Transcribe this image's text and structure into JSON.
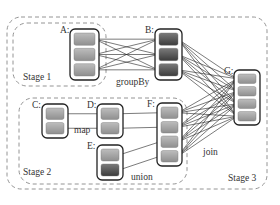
{
  "diagram": {
    "stages": [
      {
        "label": "Stage 1",
        "x": 13,
        "y": 23,
        "w": 93,
        "h": 63
      },
      {
        "label": "Stage 2",
        "x": 19,
        "y": 98,
        "w": 168,
        "h": 86
      },
      {
        "label": "Stage 3",
        "x": 7,
        "y": 17,
        "w": 260,
        "h": 172
      }
    ],
    "rdds": [
      {
        "id": "A",
        "label": "A:",
        "x": 70,
        "y": 29,
        "w": 29,
        "h": 51,
        "partitions": [
          "light",
          "light",
          "light"
        ]
      },
      {
        "id": "B",
        "label": "B:",
        "x": 155,
        "y": 29,
        "w": 27,
        "h": 51,
        "partitions": [
          "dark",
          "dark",
          "dark"
        ]
      },
      {
        "id": "C",
        "label": "C:",
        "x": 42,
        "y": 104,
        "w": 26,
        "h": 34,
        "partitions": [
          "light",
          "light"
        ]
      },
      {
        "id": "D",
        "label": "D:",
        "x": 97,
        "y": 104,
        "w": 26,
        "h": 34,
        "partitions": [
          "light",
          "light"
        ]
      },
      {
        "id": "E",
        "label": "E:",
        "x": 97,
        "y": 145,
        "w": 26,
        "h": 35,
        "partitions": [
          "light",
          "dark"
        ]
      },
      {
        "id": "F",
        "label": "F:",
        "x": 157,
        "y": 103,
        "w": 25,
        "h": 63,
        "partitions": [
          "light",
          "light",
          "light",
          "light"
        ]
      },
      {
        "id": "G",
        "label": "G:",
        "x": 234,
        "y": 70,
        "w": 26,
        "h": 55,
        "partitions": [
          "light",
          "light",
          "light",
          "light"
        ]
      }
    ],
    "operations": [
      {
        "label": "groupBy",
        "x": 116,
        "y": 85
      },
      {
        "label": "map",
        "x": 74,
        "y": 133
      },
      {
        "label": "union",
        "x": 131,
        "y": 180
      },
      {
        "label": "join",
        "x": 203,
        "y": 155
      }
    ],
    "colors": {
      "light_partition": "#9e9e9e",
      "dark_partition": "#505050",
      "stage_border": "#888888",
      "rdd_border": "#222222"
    }
  }
}
